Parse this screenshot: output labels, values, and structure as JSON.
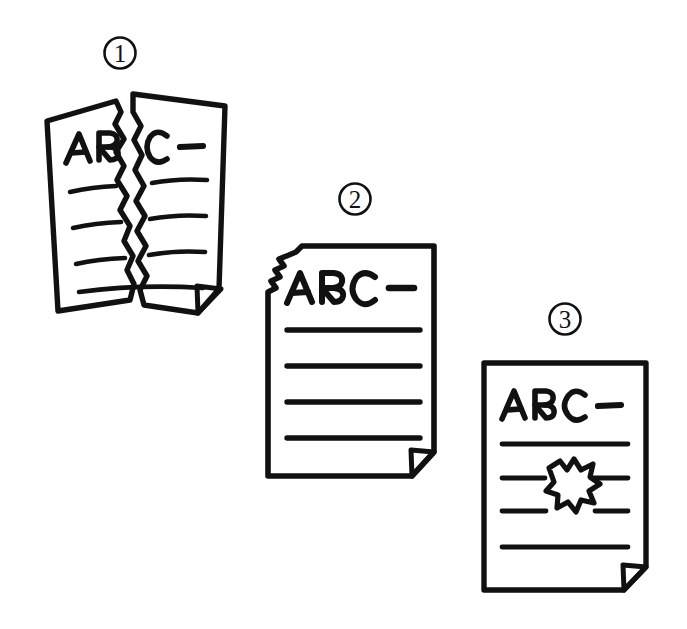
{
  "illustration": {
    "title": "Three damaged document states",
    "style": "hand-drawn line art",
    "background_color": "#ffffff",
    "ink_color": "#111111",
    "canvas": {
      "width": 687,
      "height": 629
    }
  },
  "items": [
    {
      "marker": "1",
      "marker_glyph": "①",
      "name": "torn-in-half-document",
      "damage": "torn vertically in half",
      "heading_text": "ABC—",
      "body_line_count": 4,
      "has_folded_corner": true,
      "folded_corner_position": "bottom-right"
    },
    {
      "marker": "2",
      "marker_glyph": "②",
      "name": "torn-corner-document",
      "damage": "top-left corner torn away",
      "heading_text": "ABC—",
      "body_line_count": 4,
      "has_folded_corner": true,
      "folded_corner_position": "bottom-right"
    },
    {
      "marker": "3",
      "marker_glyph": "③",
      "name": "hole-punched-document",
      "damage": "ragged hole through the middle",
      "heading_text": "ABC—",
      "body_line_count": 4,
      "has_folded_corner": true,
      "folded_corner_position": "bottom-right"
    }
  ]
}
